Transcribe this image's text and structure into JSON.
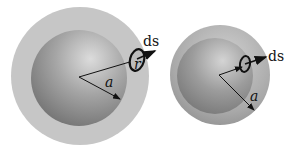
{
  "diagram": {
    "figures": [
      {
        "id": "left",
        "outer_shell": {
          "cx": 80,
          "cy": 76,
          "r": 69
        },
        "inner_sphere": {
          "cx": 79,
          "cy": 78,
          "r": 48
        },
        "labels": {
          "radius": "a",
          "vector": "r",
          "element": "ds"
        }
      },
      {
        "id": "right",
        "outer_shell": {
          "cx": 220,
          "cy": 75,
          "r": 50
        },
        "inner_sphere": {
          "cx": 215,
          "cy": 76,
          "r": 38
        },
        "labels": {
          "radius": "a",
          "element": "ds"
        }
      }
    ],
    "colors": {
      "outer_shell": "#c4c4c4",
      "inner_light": "#d8d8d8",
      "inner_dark": "#7a7a7a",
      "line": "#111111"
    }
  }
}
